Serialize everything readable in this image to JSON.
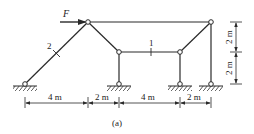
{
  "diagram": {
    "caption": "(a)",
    "force_label": "F",
    "member_labels": {
      "beam_1": "1",
      "diagonal_2": "2"
    },
    "dimensions": {
      "horizontal": [
        "4 m",
        "2 m",
        "4 m",
        "2 m"
      ],
      "vertical": [
        "2 m",
        "2 m"
      ]
    },
    "colors": {
      "line": "#2a2a2a",
      "background": "#ffffff"
    }
  }
}
